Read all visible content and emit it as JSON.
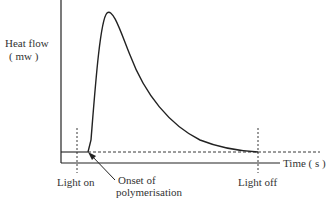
{
  "diagram": {
    "y_axis_label_line1": "Heat flow",
    "y_axis_label_line2": "( mw )",
    "x_axis_label": "Time ( s )",
    "annotations": {
      "light_on": "Light on",
      "onset_line1": "Onset of",
      "onset_line2": "polymerisation",
      "light_off": "Light off"
    },
    "colors": {
      "line": "#222222",
      "background": "#ffffff"
    }
  }
}
